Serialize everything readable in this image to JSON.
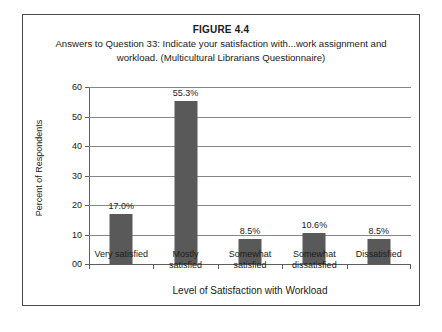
{
  "figure": {
    "number": "FIGURE 4.4",
    "caption": "Answers to Question 33: Indicate your satisfaction with...work assignment and workload. (Multicultural Librarians Questionnaire)"
  },
  "chart_data": {
    "type": "bar",
    "title": "Answers to Question 33: Indicate your satisfaction with...work assignment and workload. (Multicultural Librarians Questionnaire)",
    "xlabel": "Level of Satisfaction with Workload",
    "ylabel": "Percent of Respondents",
    "categories": [
      "Very satisfied",
      "Mostly satisfied",
      "Somewhat satisfied",
      "Somewhat dissatisfied",
      "Dissatisfied"
    ],
    "category_lines": [
      [
        "Very satisfied"
      ],
      [
        "Mostly",
        "satisfied"
      ],
      [
        "Somewhat",
        "satisfied"
      ],
      [
        "Somewhat",
        "dissatisfied"
      ],
      [
        "Dissatisfied"
      ]
    ],
    "values": [
      17.0,
      55.3,
      8.5,
      10.6,
      8.5
    ],
    "data_labels": [
      "17.0%",
      "55.3%",
      "8.5%",
      "10.6%",
      "8.5%"
    ],
    "ylim": [
      0,
      60
    ],
    "ytick_values": [
      60,
      50,
      40,
      30,
      20,
      10,
      0
    ],
    "ytick_labels": [
      "60",
      "50",
      "40",
      "30",
      "20",
      "10",
      "00"
    ],
    "grid": true,
    "legend": false,
    "bar_color": "#595959",
    "gridline_color": "#868686",
    "axis_color": "#5e5e5e",
    "border_color": "#4a4a4a",
    "background": "#ffffff"
  }
}
